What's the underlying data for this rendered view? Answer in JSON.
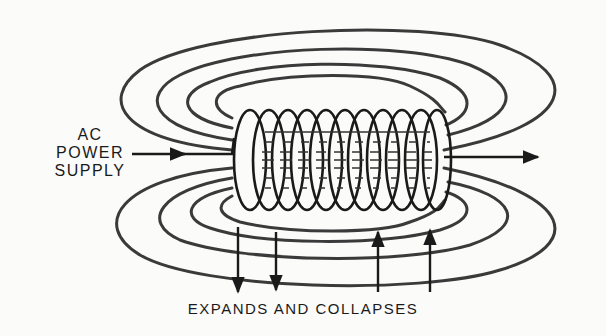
{
  "diagram": {
    "input_label": {
      "lines": [
        "AC",
        "POWER",
        "SUPPLY"
      ]
    },
    "caption": "EXPANDS AND COLLAPSES",
    "coil": {
      "turns": 11
    },
    "field_loops": {
      "upper": 4,
      "lower": 4
    },
    "arrows": {
      "input": "right",
      "output": "right",
      "field_motion": [
        "down",
        "down",
        "up",
        "up"
      ]
    },
    "colors": {
      "ink": "#1a1a1a",
      "field_line": "#3a3a3a",
      "background": "#fbfbfa"
    }
  }
}
